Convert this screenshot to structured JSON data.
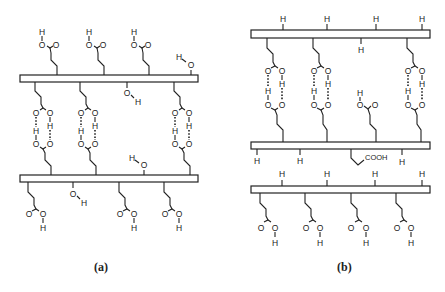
{
  "figure": {
    "panels": [
      {
        "id": "a",
        "label": "(a)",
        "description": "Two polymer chains with carboxylic acid side groups forming cyclic hydrogen-bonded dimers between chains; free hydroxyl groups present"
      },
      {
        "id": "b",
        "label": "(b)",
        "description": "Chains with carboxylic acid groups dimerized between chains, hydrogen atoms on backbone, one free COOH group"
      }
    ],
    "atoms": {
      "oxygen": "O",
      "hydrogen": "H",
      "carboxyl": "COOH"
    }
  }
}
